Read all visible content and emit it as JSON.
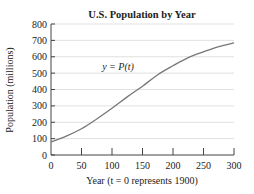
{
  "chart_data": {
    "type": "line",
    "title": "U.S. Population by Year",
    "xlabel": "Year (t = 0 represents 1900)",
    "ylabel": "Population (millions)",
    "annotation": "y = P(t)",
    "xlim": [
      0,
      300
    ],
    "ylim": [
      0,
      800
    ],
    "xticks": [
      0,
      50,
      100,
      150,
      200,
      250,
      300
    ],
    "yticks": [
      0,
      100,
      200,
      300,
      400,
      500,
      600,
      700,
      800
    ],
    "grid": "horizontal",
    "legend": "none",
    "series": [
      {
        "name": "P(t)",
        "x": [
          0,
          25,
          50,
          75,
          100,
          125,
          150,
          175,
          200,
          225,
          250,
          275,
          300
        ],
        "values": [
          80,
          115,
          160,
          220,
          285,
          355,
          420,
          490,
          545,
          595,
          630,
          662,
          685
        ]
      }
    ],
    "colors": {
      "curve": "#777777",
      "grid": "#d9d9d9",
      "axis": "#444444"
    }
  }
}
